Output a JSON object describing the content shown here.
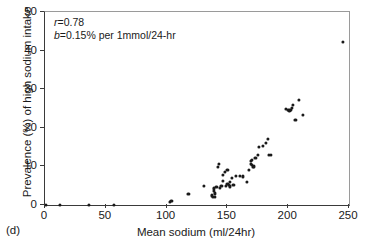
{
  "panel": {
    "label": "(d)"
  },
  "annotation": {
    "line1_symbol": "r",
    "line1_value": "=0.78",
    "line2_symbol": "b",
    "line2_value": "=0.15% per 1mmol/24-hr"
  },
  "chart_data": {
    "type": "scatter",
    "title": "",
    "xlabel": "Mean sodium (ml/24hr)",
    "ylabel": "Prevalence (%) of high sodium intake",
    "xlim": [
      0,
      250
    ],
    "ylim": [
      0,
      50
    ],
    "xticks": [
      0,
      50,
      100,
      150,
      200,
      250
    ],
    "yticks": [
      0,
      10,
      20,
      30,
      40,
      50
    ],
    "grid": false,
    "legend": "none",
    "marker": "filled-circle",
    "marker_color": "#1a1a1a",
    "series": [
      {
        "name": "populations",
        "points": [
          [
            1,
            0.0
          ],
          [
            12,
            0.1
          ],
          [
            36,
            0.1
          ],
          [
            57,
            0.1
          ],
          [
            103,
            0.7
          ],
          [
            104,
            1.0
          ],
          [
            118,
            2.9
          ],
          [
            131,
            4.9
          ],
          [
            137,
            2.5
          ],
          [
            138,
            2.2
          ],
          [
            139,
            3.6
          ],
          [
            139,
            4.3
          ],
          [
            140,
            3.0
          ],
          [
            140,
            2.1
          ],
          [
            141,
            4.6
          ],
          [
            142,
            9.9
          ],
          [
            143,
            10.6
          ],
          [
            144,
            4.5
          ],
          [
            145,
            5.0
          ],
          [
            146,
            7.7
          ],
          [
            146,
            6.3
          ],
          [
            148,
            8.6
          ],
          [
            149,
            4.9
          ],
          [
            150,
            9.1
          ],
          [
            150,
            5.4
          ],
          [
            151,
            5.2
          ],
          [
            152,
            6.0
          ],
          [
            152,
            4.8
          ],
          [
            154,
            7.0
          ],
          [
            155,
            5.3
          ],
          [
            157,
            7.6
          ],
          [
            160,
            7.5
          ],
          [
            163,
            7.4
          ],
          [
            166,
            6.0
          ],
          [
            168,
            9.0
          ],
          [
            169,
            11.5
          ],
          [
            169,
            10.7
          ],
          [
            170,
            11.6
          ],
          [
            170,
            10.3
          ],
          [
            171,
            9.9
          ],
          [
            172,
            10.1
          ],
          [
            172,
            9.8
          ],
          [
            173,
            12.3
          ],
          [
            175,
            12.9
          ],
          [
            176,
            15.1
          ],
          [
            179,
            15.3
          ],
          [
            182,
            16.0
          ],
          [
            183,
            17.1
          ],
          [
            184,
            12.9
          ],
          [
            186,
            12.9
          ],
          [
            198,
            24.8
          ],
          [
            200,
            24.6
          ],
          [
            201,
            24.5
          ],
          [
            202,
            24.6
          ],
          [
            203,
            25.1
          ],
          [
            204,
            26.0
          ],
          [
            206,
            22.0
          ],
          [
            209,
            27.2
          ],
          [
            212,
            23.4
          ],
          [
            245,
            42.3
          ]
        ]
      }
    ]
  }
}
